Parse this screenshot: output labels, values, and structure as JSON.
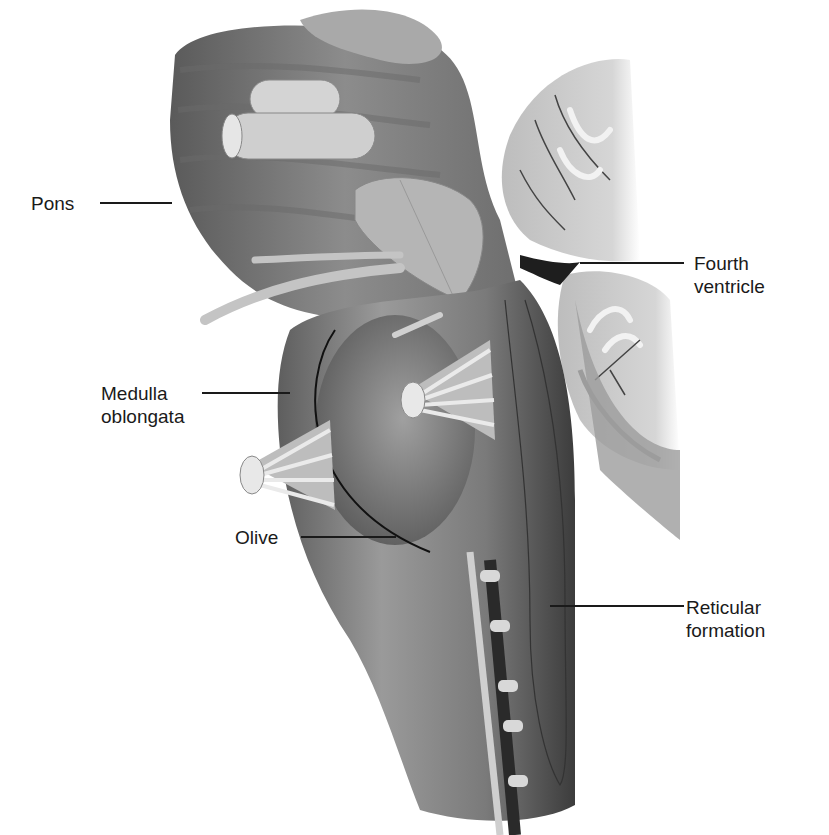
{
  "figure": {
    "colors": {
      "background": "#ffffff",
      "label_text": "#1a1a1a",
      "leader_line": "#1a1a1a",
      "tissue_dark": "#4a4a4a",
      "tissue_mid": "#8a8a8a",
      "tissue_light": "#c8c8c8"
    }
  },
  "labels": [
    {
      "id": "pons",
      "text": "Pons",
      "x": 31,
      "y": 192,
      "line": {
        "x1": 100,
        "x2": 172,
        "y": 203
      }
    },
    {
      "id": "fourth-ventricle",
      "text": "Fourth\nventricle",
      "x": 694,
      "y": 252,
      "line": {
        "x1": 580,
        "x2": 684,
        "y": 263
      }
    },
    {
      "id": "medulla-oblongata",
      "text": "Medulla\noblongata",
      "x": 101,
      "y": 382,
      "line": {
        "x1": 202,
        "x2": 290,
        "y": 393
      }
    },
    {
      "id": "olive",
      "text": "Olive",
      "x": 235,
      "y": 526,
      "line": {
        "x1": 301,
        "x2": 396,
        "y": 537
      }
    },
    {
      "id": "reticular-formation",
      "text": "Reticular\nformation",
      "x": 686,
      "y": 599,
      "line": {
        "x1": 550,
        "x2": 684,
        "y": 606
      }
    }
  ]
}
